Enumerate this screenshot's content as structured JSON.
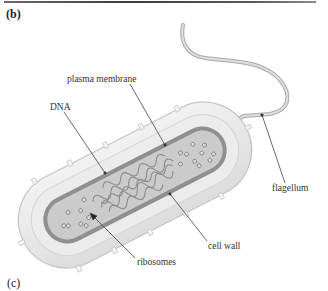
{
  "figure": {
    "panel_top": "(b)",
    "panel_bottom": "(c)",
    "labels": {
      "plasma_membrane": "plasma membrane",
      "dna": "DNA",
      "flagellum": "flagellum",
      "cell_wall": "cell wall",
      "ribosomes": "ribosomes"
    },
    "colors": {
      "cell_wall": "#e6e6e6",
      "cell_wall_edge": "#cfcfcf",
      "membrane": "#8e8e8e",
      "cytoplasm": "#c9c9c9",
      "dna": "#9a9a9a",
      "flagellum": "#bdbdbd",
      "leader_line": "#444444"
    }
  }
}
